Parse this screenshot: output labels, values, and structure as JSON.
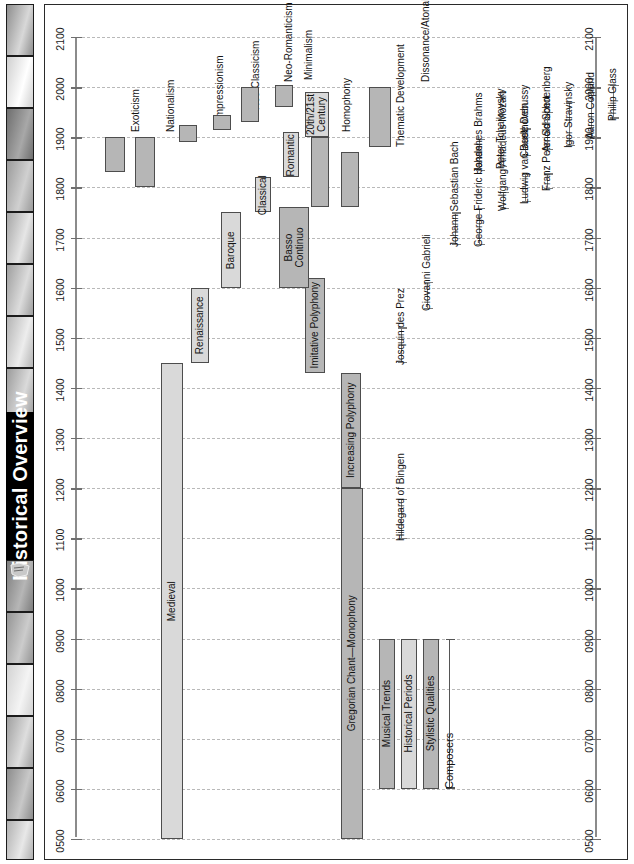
{
  "sidebar": {
    "title": "Historical Overview",
    "doc_icon": "document-thumbnail-icon",
    "thumbnails": [
      {
        "name": "thumb-1",
        "top": 0,
        "height": 52,
        "from": "#8e8e8e",
        "to": "#d8d8d8"
      },
      {
        "name": "thumb-2",
        "top": 52,
        "height": 52,
        "from": "#cfcfcf",
        "to": "#ffffff"
      },
      {
        "name": "thumb-3",
        "top": 104,
        "height": 52,
        "from": "#6e6e6e",
        "to": "#a8a8a8"
      },
      {
        "name": "thumb-4",
        "top": 156,
        "height": 52,
        "from": "#9a9a9a",
        "to": "#d0d0d0"
      },
      {
        "name": "thumb-5",
        "top": 208,
        "height": 52,
        "from": "#a6a6a6",
        "to": "#e6e6e6"
      },
      {
        "name": "thumb-6",
        "top": 260,
        "height": 52,
        "from": "#9e9e9e",
        "to": "#dcdcdc"
      },
      {
        "name": "thumb-7",
        "top": 312,
        "height": 52,
        "from": "#b4b4b4",
        "to": "#ededed"
      },
      {
        "name": "thumb-8",
        "top": 364,
        "height": 52,
        "from": "#9b9b9b",
        "to": "#dadada"
      },
      {
        "name": "thumb-9",
        "top": 556,
        "height": 52,
        "from": "#7d7d7d",
        "to": "#b6b6b6"
      },
      {
        "name": "thumb-10",
        "top": 608,
        "height": 52,
        "from": "#949494",
        "to": "#cccccc"
      },
      {
        "name": "thumb-11",
        "top": 660,
        "height": 52,
        "from": "#d2d2d2",
        "to": "#f4f4f4"
      },
      {
        "name": "thumb-12",
        "top": 712,
        "height": 52,
        "from": "#a0a0a0",
        "to": "#dedede"
      },
      {
        "name": "thumb-13",
        "top": 764,
        "height": 52,
        "from": "#8c8c8c",
        "to": "#c8c8c8"
      },
      {
        "name": "thumb-14",
        "top": 816,
        "height": 40,
        "from": "#b0b0b0",
        "to": "#e8e8e8"
      }
    ],
    "titlebar": {
      "top": 408,
      "height": 148
    }
  },
  "chart_data": {
    "type": "timeline",
    "title": "Historical Overview",
    "orientation": "vertical-time-axis",
    "axis": {
      "label": "",
      "min": 500,
      "max": 2100,
      "grid": true,
      "tick_labels": [
        "2100",
        "2000",
        "1900",
        "1800",
        "1700",
        "1600",
        "1500",
        "1400",
        "1300",
        "1200",
        "1100",
        "1000",
        "0900",
        "0800",
        "0700",
        "0600",
        "0500"
      ],
      "ticks": [
        2100,
        2000,
        1900,
        1800,
        1700,
        1600,
        1500,
        1400,
        1300,
        1200,
        1100,
        1000,
        900,
        800,
        700,
        600,
        500
      ],
      "axes_shown": [
        "left",
        "right"
      ]
    },
    "colors": {
      "musical_trends": "#b6b6b6",
      "historical_periods": "#d9d9d9",
      "stylistic_qualities": "#b6b6b6",
      "composers": "#7b7b7b",
      "bar_stroke": "#4d4d4d",
      "grid": "#b9b9b9",
      "axis": "#8b8b8b",
      "title_bar": "#000000",
      "title_text": "#ffffff"
    },
    "series": [
      {
        "name": "Historical Periods",
        "category": "historical_periods",
        "fill": "#d9d9d9",
        "bars": [
          {
            "label": "Medieval",
            "start": 500,
            "end": 1450,
            "label_pos": "inside"
          },
          {
            "label": "Renaissance",
            "start": 1450,
            "end": 1600,
            "label_pos": "inside"
          },
          {
            "label": "Baroque",
            "start": 1600,
            "end": 1750,
            "label_pos": "inside"
          },
          {
            "label": "Classical",
            "start": 1750,
            "end": 1820,
            "label_pos": "inside"
          },
          {
            "label": "Romantic",
            "start": 1820,
            "end": 1910,
            "label_pos": "inside"
          },
          {
            "label": "20th/21st Century",
            "start": 1900,
            "end": 1990,
            "label_pos": "inside"
          }
        ]
      },
      {
        "name": "Musical Trends",
        "category": "musical_trends",
        "fill": "#b6b6b6",
        "bars": [
          {
            "label": "Gregorian Chant—Monophony",
            "start": 500,
            "end": 1200,
            "label_pos": "inside"
          },
          {
            "label": "Increasing Polyphony",
            "start": 1200,
            "end": 1430,
            "label_pos": "inside"
          },
          {
            "label": "Imitative Polyphony",
            "start": 1430,
            "end": 1620,
            "label_pos": "inside"
          },
          {
            "label": "Basso Continuo",
            "start": 1600,
            "end": 1760,
            "label_pos": "inside"
          },
          {
            "label": "Homophony",
            "start": 1760,
            "end": 1900,
            "label_pos": "outside"
          },
          {
            "label": "Thematic Development",
            "start": 1760,
            "end": 1870,
            "label_pos": "outside"
          },
          {
            "label": "Dissonance/Atonality",
            "start": 1880,
            "end": 2000,
            "label_pos": "outside"
          }
        ]
      },
      {
        "name": "Stylistic Qualities",
        "category": "stylistic_qualities",
        "fill": "#b6b6b6",
        "bars": [
          {
            "label": "Exoticism",
            "start": 1830,
            "end": 1900,
            "label_pos": "outside"
          },
          {
            "label": "Nationalism",
            "start": 1800,
            "end": 1900,
            "label_pos": "outside"
          },
          {
            "label": "Impressionism",
            "start": 1890,
            "end": 1925,
            "label_pos": "outside"
          },
          {
            "label": "Neo-Classicism",
            "start": 1915,
            "end": 1945,
            "label_pos": "outside"
          },
          {
            "label": "Neo-Romanticism",
            "start": 1930,
            "end": 2000,
            "label_pos": "outside"
          },
          {
            "label": "Minimalism",
            "start": 1960,
            "end": 2005,
            "label_pos": "outside"
          }
        ]
      }
    ],
    "composers": [
      {
        "name": "Hildegard of Bingen",
        "start": 1098,
        "end": 1179
      },
      {
        "name": "Josquin des Prez",
        "start": 1450,
        "end": 1521
      },
      {
        "name": "Giovanni Gabrieli",
        "start": 1557,
        "end": 1612
      },
      {
        "name": "Johann Sebastian Bach",
        "start": 1685,
        "end": 1750
      },
      {
        "name": "George Frideric Handel",
        "start": 1685,
        "end": 1759
      },
      {
        "name": "Wolfgang Amadeus Mozart",
        "start": 1756,
        "end": 1791
      },
      {
        "name": "Ludwig van Beethoven",
        "start": 1770,
        "end": 1827
      },
      {
        "name": "Franz Peter Schubert",
        "start": 1797,
        "end": 1828
      },
      {
        "name": "Johannes Brahms",
        "start": 1833,
        "end": 1897
      },
      {
        "name": "Peter Tchaikovsky",
        "start": 1840,
        "end": 1893
      },
      {
        "name": "Claude Debussy",
        "start": 1862,
        "end": 1918
      },
      {
        "name": "Arnold Schoenberg",
        "start": 1874,
        "end": 1951
      },
      {
        "name": "Igor Stravinsky",
        "start": 1882,
        "end": 1971
      },
      {
        "name": "Aaron Copland",
        "start": 1900,
        "end": 1990
      },
      {
        "name": "Philip Glass",
        "start": 1937,
        "end": 2005
      }
    ],
    "legend": {
      "position": "bottom-center",
      "from": 600,
      "to": 900,
      "entries": [
        {
          "label": "Musical Trends",
          "swatch": "#b6b6b6",
          "kind": "bar"
        },
        {
          "label": "Historical Periods",
          "swatch": "#d9d9d9",
          "kind": "bar"
        },
        {
          "label": "Stylistic Qualities",
          "swatch": "#b6b6b6",
          "kind": "bar"
        },
        {
          "label": "Composers",
          "swatch": "#7b7b7b",
          "kind": "range"
        }
      ]
    }
  }
}
